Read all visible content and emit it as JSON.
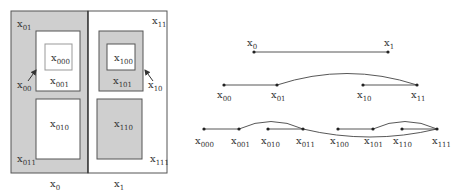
{
  "colors": {
    "shade": "#cfcfcf",
    "stroke": "#555555",
    "text": "#333333",
    "background": "#ffffff"
  },
  "left_figure": {
    "regions": [
      {
        "id": "x0",
        "base": "x",
        "sub": "0"
      },
      {
        "id": "x1",
        "base": "x",
        "sub": "1"
      },
      {
        "id": "x01",
        "base": "x",
        "sub": "01"
      },
      {
        "id": "x00",
        "base": "x",
        "sub": "00"
      },
      {
        "id": "x11",
        "base": "x",
        "sub": "11"
      },
      {
        "id": "x10",
        "base": "x",
        "sub": "10"
      },
      {
        "id": "x000",
        "base": "x",
        "sub": "000"
      },
      {
        "id": "x001",
        "base": "x",
        "sub": "001"
      },
      {
        "id": "x010",
        "base": "x",
        "sub": "010"
      },
      {
        "id": "x011",
        "base": "x",
        "sub": "011"
      },
      {
        "id": "x100",
        "base": "x",
        "sub": "100"
      },
      {
        "id": "x101",
        "base": "x",
        "sub": "101"
      },
      {
        "id": "x110",
        "base": "x",
        "sub": "110"
      },
      {
        "id": "x111",
        "base": "x",
        "sub": "111"
      }
    ]
  },
  "right_figure": {
    "levels": [
      {
        "nodes": [
          {
            "base": "x",
            "sub": "0"
          },
          {
            "base": "x",
            "sub": "1"
          }
        ],
        "edges": [
          [
            "x0",
            "x1",
            "straight"
          ]
        ]
      },
      {
        "nodes": [
          {
            "base": "x",
            "sub": "00"
          },
          {
            "base": "x",
            "sub": "01"
          },
          {
            "base": "x",
            "sub": "10"
          },
          {
            "base": "x",
            "sub": "11"
          }
        ],
        "edges": [
          [
            "x00",
            "x01",
            "straight"
          ],
          [
            "x01",
            "x11",
            "arc-up"
          ],
          [
            "x10",
            "x11",
            "straight"
          ]
        ]
      },
      {
        "nodes": [
          {
            "base": "x",
            "sub": "000"
          },
          {
            "base": "x",
            "sub": "001"
          },
          {
            "base": "x",
            "sub": "010"
          },
          {
            "base": "x",
            "sub": "011"
          },
          {
            "base": "x",
            "sub": "100"
          },
          {
            "base": "x",
            "sub": "101"
          },
          {
            "base": "x",
            "sub": "110"
          },
          {
            "base": "x",
            "sub": "111"
          }
        ],
        "edges": [
          [
            "x000",
            "x001",
            "straight"
          ],
          [
            "x001",
            "x011",
            "arc-up"
          ],
          [
            "x010",
            "x011",
            "straight"
          ],
          [
            "x011",
            "x111",
            "arc-down"
          ],
          [
            "x100",
            "x101",
            "straight"
          ],
          [
            "x101",
            "x111",
            "arc-up"
          ],
          [
            "x110",
            "x111",
            "straight"
          ]
        ]
      }
    ]
  },
  "labels": {
    "x": "x",
    "s0": "0",
    "s1": "1",
    "s00": "00",
    "s01": "01",
    "s10": "10",
    "s11": "11",
    "s000": "000",
    "s001": "001",
    "s010": "010",
    "s011": "011",
    "s100": "100",
    "s101": "101",
    "s110": "110",
    "s111": "111"
  }
}
